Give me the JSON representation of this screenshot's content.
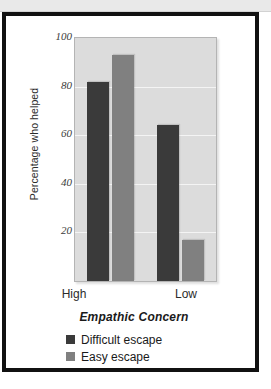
{
  "figure": {
    "background": "#ffffff",
    "frame_color": "#111111",
    "header_strip_color": "#e9e9e9"
  },
  "chart_data": {
    "type": "bar",
    "title": "",
    "xlabel": "Empathic Concern",
    "ylabel": "Percentage who helped",
    "categories": [
      "High",
      "Low"
    ],
    "series": [
      {
        "name": "Difficult escape",
        "color": "#3a3a3a",
        "values": [
          82,
          64
        ]
      },
      {
        "name": "Easy escape",
        "color": "#808080",
        "values": [
          93,
          17
        ]
      }
    ],
    "ylim": [
      0,
      100
    ],
    "yticks": [
      100,
      80,
      60,
      40,
      20
    ],
    "ytick_labels": [
      "100",
      "80",
      "60",
      "40",
      "20"
    ],
    "grid": true,
    "grid_color": "#f4f4f4",
    "plot_background": "#dcdcdc",
    "legend_position": "below-axis-left"
  },
  "legend": {
    "items": [
      {
        "label": "Difficult escape",
        "color": "#3a3a3a"
      },
      {
        "label": "Easy escape",
        "color": "#808080"
      }
    ]
  }
}
